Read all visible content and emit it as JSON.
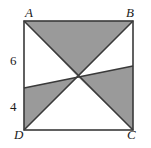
{
  "figure": {
    "type": "geometry-diagram",
    "shape": "square",
    "colors": {
      "background": "#ffffff",
      "shaded_fill": "#9a9a9a",
      "stroke": "#3a3a3a",
      "text": "#1a1a1a"
    },
    "square": {
      "x": 24,
      "y": 21,
      "width": 109,
      "height": 109
    },
    "vertices": [
      {
        "name": "A",
        "label": "A",
        "corner": "top-left",
        "x": 24,
        "y": 21
      },
      {
        "name": "B",
        "label": "B",
        "corner": "top-right",
        "x": 133,
        "y": 21
      },
      {
        "name": "C",
        "label": "C",
        "corner": "bottom-right",
        "x": 133,
        "y": 130
      },
      {
        "name": "D",
        "label": "D",
        "corner": "bottom-left",
        "x": 24,
        "y": 130
      }
    ],
    "center": {
      "x": 78,
      "y": 77
    },
    "segment_labels": [
      {
        "name": "upper-left-segment",
        "label": "6",
        "side": "left",
        "x": 10,
        "y": 54
      },
      {
        "name": "lower-left-segment",
        "label": "4",
        "side": "left",
        "x": 10,
        "y": 100
      }
    ],
    "lines": [
      {
        "name": "diagonal-AC",
        "from": "A",
        "to": "C"
      },
      {
        "name": "diagonal-BD",
        "from": "B",
        "to": "D"
      },
      {
        "name": "transversal-EF",
        "from_edge": "left",
        "from_y": 88,
        "to_edge": "right",
        "to_y": 66
      }
    ],
    "shaded_regions": [
      {
        "name": "top-triangle",
        "points": "24,21 133,21 78,77"
      },
      {
        "name": "bottom-left-triangle",
        "points": "24,88 24,130 78,77"
      },
      {
        "name": "right-region",
        "points": "78,77 133,66 133,130"
      }
    ]
  }
}
